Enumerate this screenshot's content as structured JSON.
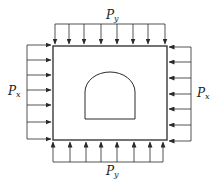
{
  "diagram": {
    "type": "loaded-rock-mass-with-tunnel",
    "colors": {
      "stroke": "#2a2a2a",
      "background": "#ffffff"
    },
    "labels": {
      "top": {
        "base": "P",
        "sub": "y"
      },
      "bottom": {
        "base": "P",
        "sub": "y"
      },
      "left": {
        "base": "P",
        "sub": "x"
      },
      "right": {
        "base": "P",
        "sub": "x"
      }
    },
    "block": {
      "x": 53,
      "y": 46,
      "width": 114,
      "height": 94
    },
    "tunnel": {
      "shape": "horseshoe",
      "left": 85,
      "right": 135,
      "arch_spring_y": 92,
      "bottom_y": 119,
      "crown_y": 72
    },
    "top_arrows": {
      "count": 8,
      "x": [
        55,
        69,
        84,
        101,
        117,
        133,
        148,
        165
      ],
      "bracket_y": 24,
      "tip_y": 44
    },
    "bottom_arrows": {
      "count": 8,
      "x": [
        53,
        70,
        86,
        101,
        117,
        134,
        150,
        163
      ],
      "bracket_y": 162,
      "tip_y": 142
    },
    "left_arrows": {
      "count": 7,
      "y": [
        45,
        60,
        75,
        90,
        105,
        122,
        139
      ],
      "bracket_x": 27,
      "tip_x": 51
    },
    "right_arrows": {
      "count": 7,
      "y": [
        47,
        62,
        78,
        94,
        109,
        125,
        141
      ],
      "bracket_x": 191,
      "tip_x": 169
    }
  }
}
